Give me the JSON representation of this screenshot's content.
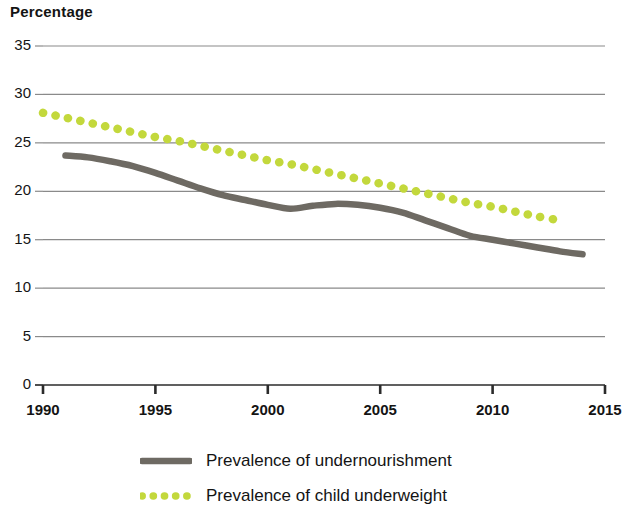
{
  "chart_data": {
    "type": "line",
    "title": "Percentage",
    "xlabel": "",
    "ylabel": "Percentage",
    "xlim": [
      1990,
      2015
    ],
    "ylim": [
      0,
      35
    ],
    "grid": true,
    "legend_position": "bottom",
    "y_ticks": [
      0,
      5,
      10,
      15,
      20,
      25,
      30,
      35
    ],
    "y_tick_labels": [
      "0",
      "5",
      "10",
      "15",
      "20",
      "25",
      "30",
      "35"
    ],
    "x_ticks": [
      1990,
      1995,
      2000,
      2005,
      2010,
      2015
    ],
    "x_tick_labels": [
      "1990",
      "1995",
      "2000",
      "2005",
      "2010",
      "2015"
    ],
    "series": [
      {
        "name": "Prevalence of undernourishment",
        "style": "solid",
        "color": "#6e6a63",
        "x": [
          1991,
          1992,
          1993,
          1994,
          1995,
          1996,
          1997,
          1998,
          1999,
          2000,
          2001,
          2002,
          2003,
          2004,
          2005,
          2006,
          2007,
          2008,
          2009,
          2010,
          2011,
          2012,
          2013,
          2014
        ],
        "values": [
          23.7,
          23.5,
          23.1,
          22.6,
          21.9,
          21.1,
          20.3,
          19.6,
          19.1,
          18.6,
          18.2,
          18.5,
          18.7,
          18.6,
          18.3,
          17.8,
          17.0,
          16.2,
          15.4,
          15.0,
          14.6,
          14.2,
          13.8,
          13.5
        ]
      },
      {
        "name": "Prevalence of child underweight",
        "style": "dotted",
        "color": "#c3d83c",
        "x": [
          1990,
          1991,
          1992,
          1993,
          1994,
          1995,
          1996,
          1997,
          1998,
          1999,
          2000,
          2001,
          2002,
          2003,
          2004,
          2005,
          2006,
          2007,
          2008,
          2009,
          2010,
          2011,
          2012,
          2013
        ],
        "values": [
          28.1,
          27.6,
          27.1,
          26.6,
          26.1,
          25.6,
          25.2,
          24.7,
          24.2,
          23.7,
          23.2,
          22.8,
          22.3,
          21.8,
          21.3,
          20.8,
          20.3,
          19.8,
          19.3,
          18.8,
          18.4,
          17.9,
          17.4,
          17.0
        ]
      }
    ],
    "legend": [
      {
        "label": "Prevalence of undernourishment",
        "style": "solid",
        "color": "#6e6a63"
      },
      {
        "label": "Prevalence of child underweight",
        "style": "dotted",
        "color": "#c3d83c"
      }
    ],
    "colors": {
      "undernourishment": "#6e6a63",
      "child_underweight": "#c3d83c",
      "gridline": "#8a8a8a",
      "axis": "#2b2b2b",
      "text": "#141414"
    }
  }
}
